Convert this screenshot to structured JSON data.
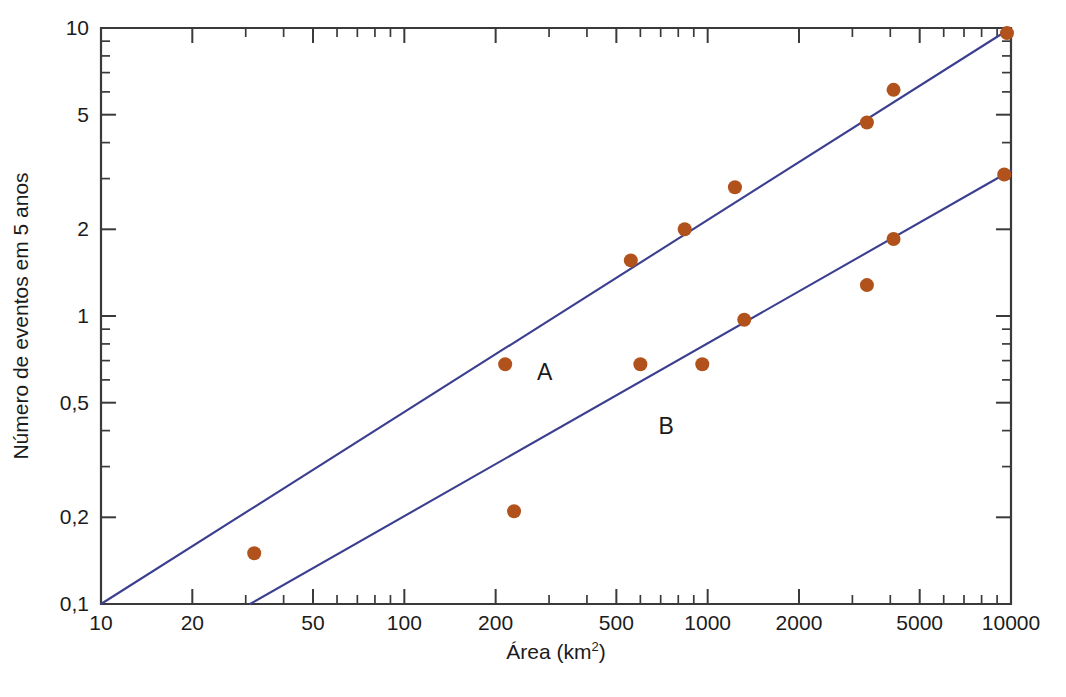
{
  "chart_data": {
    "type": "scatter",
    "title": "",
    "subtitle": "",
    "xlabel": "Área (km²)",
    "xlabel_base": "Área (km",
    "xlabel_sup": "2",
    "xlabel_tail": ")",
    "ylabel": "Número de eventos em 5 anos",
    "xscale": "log",
    "yscale": "log",
    "xlim": [
      10,
      10000
    ],
    "ylim": [
      0.1,
      10
    ],
    "grid": false,
    "legend_position": "inline-annotations",
    "xticklabels": [
      "10",
      "20",
      "50",
      "100",
      "200",
      "500",
      "1000",
      "2000",
      "5000",
      "10000"
    ],
    "xtickvalues": [
      10,
      20,
      50,
      100,
      200,
      500,
      1000,
      2000,
      5000,
      10000
    ],
    "xminorticks": [
      30,
      40,
      60,
      70,
      80,
      90,
      300,
      400,
      600,
      700,
      800,
      900,
      3000,
      4000,
      6000,
      7000,
      8000,
      9000
    ],
    "yticklabels": [
      "10",
      "5",
      "2",
      "1",
      "0,5",
      "0,2",
      "0,1"
    ],
    "ytickvalues": [
      10,
      5,
      2,
      1,
      0.5,
      0.2,
      0.1
    ],
    "yminorticks": [
      9,
      8,
      7,
      6,
      4,
      3,
      0.9,
      0.8,
      0.7,
      0.6,
      0.4,
      0.3
    ],
    "annotations": [
      {
        "text": "A",
        "x": 290,
        "y": 0.6
      },
      {
        "text": "B",
        "x": 730,
        "y": 0.39
      }
    ],
    "series": [
      {
        "name": "A",
        "label": "A",
        "marker": "circle",
        "color": "#b1521c",
        "linecolor": "#3b3f8f",
        "points": [
          {
            "x": 32,
            "y": 0.15
          },
          {
            "x": 215,
            "y": 0.68
          },
          {
            "x": 558,
            "y": 1.56
          },
          {
            "x": 840,
            "y": 2.0
          },
          {
            "x": 1230,
            "y": 2.8
          },
          {
            "x": 3350,
            "y": 4.7
          },
          {
            "x": 4100,
            "y": 6.1
          },
          {
            "x": 9700,
            "y": 9.6
          }
        ],
        "fit_line": {
          "x1": 10,
          "y1": 0.1,
          "x2": 10000,
          "y2": 10.0
        }
      },
      {
        "name": "B",
        "label": "B",
        "marker": "circle",
        "color": "#b1521c",
        "linecolor": "#3b3f8f",
        "points": [
          {
            "x": 230,
            "y": 0.21
          },
          {
            "x": 600,
            "y": 0.68
          },
          {
            "x": 960,
            "y": 0.68
          },
          {
            "x": 1320,
            "y": 0.97
          },
          {
            "x": 3350,
            "y": 1.28
          },
          {
            "x": 4100,
            "y": 1.85
          },
          {
            "x": 9500,
            "y": 3.1
          }
        ],
        "fit_line": {
          "x1": 31,
          "y1": 0.1,
          "x2": 10000,
          "y2": 3.2
        }
      }
    ],
    "colors": {
      "marker": "#b1521c",
      "line": "#3b3f8f",
      "axis": "#3a3a3a",
      "text": "#1b1b1b",
      "background": "#ffffff"
    }
  }
}
